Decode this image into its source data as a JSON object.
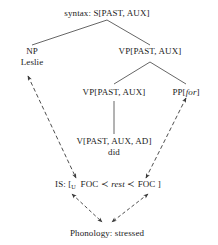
{
  "diagram": {
    "title_label": "syntax: S[PAST, AUX]",
    "nodes": {
      "root": "syntax: S[PAST, AUX]",
      "np": "NP",
      "np_word": "Leslie",
      "vp_top": "VP[PAST, AUX]",
      "vp_mid": "VP[PAST, AUX]",
      "pp_prefix": "PP[",
      "pp_italic": "for",
      "pp_suffix": "]",
      "v_node": "V[PAST, AUX, AD]",
      "v_word": "did",
      "is_prefix": "IS: [",
      "is_sub": "U",
      "is_foc1": "FOC",
      "is_prec1": "≺",
      "is_rest": "rest",
      "is_prec2": "≺",
      "is_foc2": "FOC",
      "is_suffix": "]",
      "phonology": "Phonology: stressed"
    },
    "colors": {
      "ink": "#1a1a1a",
      "line": "#555555",
      "background": "#ffffff"
    }
  }
}
